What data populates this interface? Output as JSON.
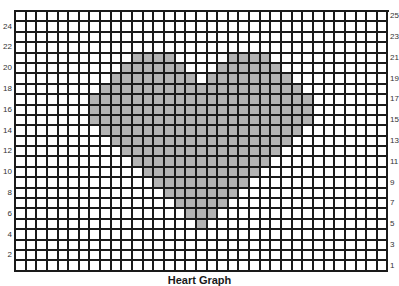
{
  "chart_data": {
    "type": "heatmap",
    "title": "Heart Graph",
    "grid": {
      "columns": 35,
      "rows": 25
    },
    "row_labels_left": [
      24,
      22,
      20,
      18,
      16,
      14,
      12,
      10,
      8,
      6,
      4,
      2
    ],
    "row_labels_right": [
      25,
      23,
      21,
      19,
      17,
      15,
      13,
      11,
      9,
      7,
      5,
      3,
      1
    ],
    "fill_color": "#b3b3b3",
    "empty_color": "#ffffff",
    "line_color": "#1a1a1a",
    "filled_ranges_by_row_from_top": [
      {
        "row_from_top": 4,
        "row_label": 21,
        "ranges": [
          [
            11,
            14
          ],
          [
            20,
            23
          ]
        ]
      },
      {
        "row_from_top": 5,
        "row_label": 20,
        "ranges": [
          [
            10,
            15
          ],
          [
            19,
            24
          ]
        ]
      },
      {
        "row_from_top": 6,
        "row_label": 19,
        "ranges": [
          [
            9,
            16
          ],
          [
            18,
            25
          ]
        ]
      },
      {
        "row_from_top": 7,
        "row_label": 18,
        "ranges": [
          [
            8,
            26
          ]
        ]
      },
      {
        "row_from_top": 8,
        "row_label": 17,
        "ranges": [
          [
            7,
            27
          ]
        ]
      },
      {
        "row_from_top": 9,
        "row_label": 16,
        "ranges": [
          [
            7,
            27
          ]
        ]
      },
      {
        "row_from_top": 10,
        "row_label": 15,
        "ranges": [
          [
            7,
            27
          ]
        ]
      },
      {
        "row_from_top": 11,
        "row_label": 14,
        "ranges": [
          [
            8,
            26
          ]
        ]
      },
      {
        "row_from_top": 12,
        "row_label": 13,
        "ranges": [
          [
            9,
            25
          ]
        ]
      },
      {
        "row_from_top": 13,
        "row_label": 12,
        "ranges": [
          [
            10,
            24
          ]
        ]
      },
      {
        "row_from_top": 14,
        "row_label": 11,
        "ranges": [
          [
            11,
            23
          ]
        ]
      },
      {
        "row_from_top": 15,
        "row_label": 10,
        "ranges": [
          [
            12,
            22
          ]
        ]
      },
      {
        "row_from_top": 16,
        "row_label": 9,
        "ranges": [
          [
            13,
            21
          ]
        ]
      },
      {
        "row_from_top": 17,
        "row_label": 8,
        "ranges": [
          [
            14,
            20
          ]
        ]
      },
      {
        "row_from_top": 18,
        "row_label": 7,
        "ranges": [
          [
            15,
            19
          ]
        ]
      },
      {
        "row_from_top": 19,
        "row_label": 6,
        "ranges": [
          [
            16,
            18
          ]
        ]
      },
      {
        "row_from_top": 20,
        "row_label": 5,
        "ranges": [
          [
            17,
            17
          ]
        ]
      }
    ]
  }
}
